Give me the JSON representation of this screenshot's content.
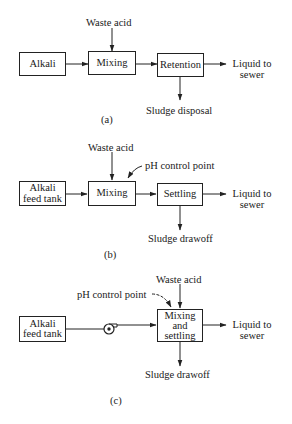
{
  "figure": {
    "panels": [
      {
        "id": "a",
        "caption": "(a)",
        "boxes": {
          "source": "Alkali",
          "mix": "Mixing",
          "tank": "Retention"
        },
        "input": "Waste acid",
        "output_liquid": [
          "Liquid to",
          "sewer"
        ],
        "output_sludge": "Sludge disposal"
      },
      {
        "id": "b",
        "caption": "(b)",
        "boxes": {
          "source": [
            "Alkali",
            "feed tank"
          ],
          "mix": "Mixing",
          "tank": "Settling"
        },
        "input": "Waste acid",
        "control": "pH control point",
        "output_liquid": [
          "Liquid to",
          "sewer"
        ],
        "output_sludge": "Sludge drawoff"
      },
      {
        "id": "c",
        "caption": "(c)",
        "boxes": {
          "source": [
            "Alkali",
            "feed tank"
          ],
          "tank": [
            "Mixing",
            "and",
            "settling"
          ]
        },
        "pump": "pump-icon",
        "input": "Waste acid",
        "control": "pH control point",
        "output_liquid": [
          "Liquid to",
          "sewer"
        ],
        "output_sludge": "Sludge drawoff"
      }
    ]
  }
}
